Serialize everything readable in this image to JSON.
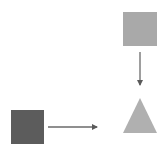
{
  "diagram": {
    "nodes": [
      {
        "id": "top-square",
        "shape": "square",
        "x": 123,
        "y": 12,
        "w": 34,
        "h": 34,
        "fill": "#a9a9a9"
      },
      {
        "id": "bottom-left-square",
        "shape": "square",
        "x": 11,
        "y": 110,
        "w": 33,
        "h": 34,
        "fill": "#5c5c5c"
      },
      {
        "id": "triangle",
        "shape": "triangle",
        "points": "140,98 123,133 157,133",
        "fill": "#b0b0b0"
      }
    ],
    "edges": [
      {
        "from": "top-square",
        "to": "triangle",
        "x1": 140,
        "y1": 52,
        "x2": 140,
        "y2": 85,
        "color": "#6a6a6a"
      },
      {
        "from": "bottom-left-square",
        "to": "triangle",
        "x1": 48,
        "y1": 127,
        "x2": 97,
        "y2": 127,
        "color": "#6a6a6a"
      }
    ]
  }
}
